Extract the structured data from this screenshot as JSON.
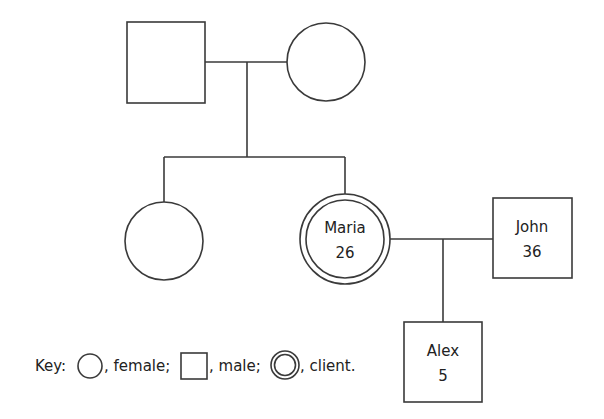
{
  "diagram": {
    "type": "genogram",
    "people": {
      "grandfather": {
        "gender": "male",
        "name": "",
        "age": ""
      },
      "grandmother": {
        "gender": "female",
        "name": "",
        "age": ""
      },
      "sister": {
        "gender": "female",
        "name": "",
        "age": ""
      },
      "maria": {
        "gender": "female",
        "client": true,
        "name": "Maria",
        "age": "26"
      },
      "john": {
        "gender": "male",
        "name": "John",
        "age": "36"
      },
      "alex": {
        "gender": "male",
        "name": "Alex",
        "age": "5"
      }
    },
    "relationships": [
      {
        "type": "partners",
        "members": [
          "grandfather",
          "grandmother"
        ]
      },
      {
        "type": "children",
        "parents": [
          "grandfather",
          "grandmother"
        ],
        "children": [
          "sister",
          "maria"
        ]
      },
      {
        "type": "partners",
        "members": [
          "maria",
          "john"
        ]
      },
      {
        "type": "children",
        "parents": [
          "maria",
          "john"
        ],
        "children": [
          "alex"
        ]
      }
    ],
    "key": {
      "prefix": "Key:",
      "female": ", female;",
      "male": ", male;",
      "client": ", client."
    }
  }
}
